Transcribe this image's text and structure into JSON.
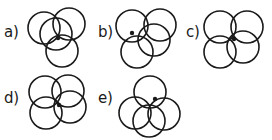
{
  "figure": {
    "background_color": "#ffffff",
    "stroke_color": "#1a1a1a",
    "marker_color": "#1a1a1a",
    "width": 272,
    "height": 140,
    "panels": [
      {
        "id": "a",
        "label": "a)",
        "label_x": 4,
        "label_y": 25,
        "diagram_x": 26,
        "diagram_y": 6,
        "diagram_w": 62,
        "diagram_h": 62,
        "circle_radius": 16,
        "circles": [
          {
            "cx": 18,
            "cy": 22
          },
          {
            "cx": 43,
            "cy": 18
          },
          {
            "cx": 30,
            "cy": 28
          },
          {
            "cx": 36,
            "cy": 45
          }
        ],
        "marker": {
          "cx": 32,
          "cy": 32,
          "r": 2.2
        }
      },
      {
        "id": "b",
        "label": "b)",
        "label_x": 98,
        "label_y": 25,
        "diagram_x": 112,
        "diagram_y": 7,
        "diagram_w": 62,
        "diagram_h": 62,
        "circle_radius": 16,
        "circles": [
          {
            "cx": 20,
            "cy": 19
          },
          {
            "cx": 48,
            "cy": 18
          },
          {
            "cx": 42,
            "cy": 33
          },
          {
            "cx": 25,
            "cy": 45
          }
        ],
        "marker": {
          "cx": 20,
          "cy": 26,
          "r": 2.2
        }
      },
      {
        "id": "c",
        "label": "c)",
        "label_x": 186,
        "label_y": 25,
        "diagram_x": 201,
        "diagram_y": 7,
        "diagram_w": 62,
        "diagram_h": 62,
        "circle_radius": 16,
        "circles": [
          {
            "cx": 19,
            "cy": 20
          },
          {
            "cx": 46,
            "cy": 20
          },
          {
            "cx": 19,
            "cy": 45
          },
          {
            "cx": 42,
            "cy": 40
          }
        ],
        "marker": {
          "cx": 33,
          "cy": 32,
          "r": 2.2
        }
      },
      {
        "id": "d",
        "label": "d)",
        "label_x": 4,
        "label_y": 91,
        "diagram_x": 26,
        "diagram_y": 73,
        "diagram_w": 62,
        "diagram_h": 62,
        "circle_radius": 16,
        "circles": [
          {
            "cx": 19,
            "cy": 19
          },
          {
            "cx": 42,
            "cy": 18
          },
          {
            "cx": 20,
            "cy": 40
          },
          {
            "cx": 44,
            "cy": 34
          }
        ],
        "marker": {
          "cx": 33,
          "cy": 32,
          "r": 2.2
        }
      },
      {
        "id": "e",
        "label": "e)",
        "label_x": 98,
        "label_y": 91,
        "diagram_x": 118,
        "diagram_y": 73,
        "diagram_w": 62,
        "diagram_h": 62,
        "circle_radius": 16,
        "circles": [
          {
            "cx": 32,
            "cy": 19
          },
          {
            "cx": 17,
            "cy": 40
          },
          {
            "cx": 46,
            "cy": 41
          },
          {
            "cx": 31,
            "cy": 48
          }
        ],
        "marker": {
          "cx": 37,
          "cy": 26,
          "r": 2.2
        }
      }
    ]
  }
}
